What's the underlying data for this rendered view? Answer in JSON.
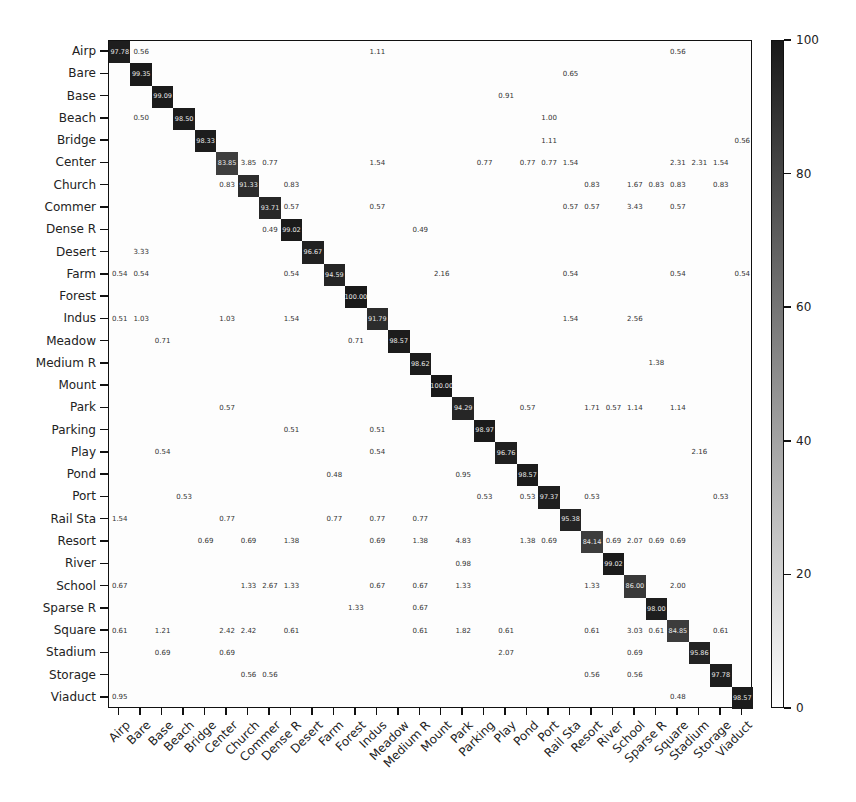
{
  "chart_data": {
    "type": "heatmap",
    "title": "",
    "xlabel": "",
    "ylabel": "",
    "labels": [
      "Airp",
      "Bare",
      "Base",
      "Beach",
      "Bridge",
      "Center",
      "Church",
      "Commer",
      "Dense R",
      "Desert",
      "Farm",
      "Forest",
      "Indus",
      "Meadow",
      "Medium R",
      "Mount",
      "Park",
      "Parking",
      "Play",
      "Pond",
      "Port",
      "Rail Sta",
      "Resort",
      "River",
      "School",
      "Sparse R",
      "Square",
      "Stadium",
      "Storage",
      "Viaduct"
    ],
    "diagonal": [
      97.78,
      99.35,
      99.09,
      98.5,
      98.33,
      83.85,
      91.33,
      93.71,
      99.02,
      96.67,
      94.59,
      100.0,
      91.79,
      98.57,
      98.62,
      100.0,
      94.29,
      98.97,
      96.76,
      98.57,
      97.37,
      95.38,
      84.14,
      99.02,
      86.0,
      98.0,
      84.85,
      95.86,
      97.78,
      98.57
    ],
    "off_diagonal": [
      {
        "row": 0,
        "col": 1,
        "v": "0.56"
      },
      {
        "row": 0,
        "col": 12,
        "v": "1.11"
      },
      {
        "row": 0,
        "col": 26,
        "v": "0.56"
      },
      {
        "row": 1,
        "col": 21,
        "v": "0.65"
      },
      {
        "row": 2,
        "col": 18,
        "v": "0.91"
      },
      {
        "row": 3,
        "col": 1,
        "v": "0.50"
      },
      {
        "row": 3,
        "col": 20,
        "v": "1.00"
      },
      {
        "row": 4,
        "col": 20,
        "v": "1.11"
      },
      {
        "row": 4,
        "col": 29,
        "v": "0.56"
      },
      {
        "row": 5,
        "col": 6,
        "v": "3.85"
      },
      {
        "row": 5,
        "col": 7,
        "v": "0.77"
      },
      {
        "row": 5,
        "col": 12,
        "v": "1.54"
      },
      {
        "row": 5,
        "col": 17,
        "v": "0.77"
      },
      {
        "row": 5,
        "col": 19,
        "v": "0.77"
      },
      {
        "row": 5,
        "col": 20,
        "v": "0.77"
      },
      {
        "row": 5,
        "col": 21,
        "v": "1.54"
      },
      {
        "row": 5,
        "col": 26,
        "v": "2.31"
      },
      {
        "row": 5,
        "col": 27,
        "v": "2.31"
      },
      {
        "row": 5,
        "col": 28,
        "v": "1.54"
      },
      {
        "row": 6,
        "col": 5,
        "v": "0.83"
      },
      {
        "row": 6,
        "col": 8,
        "v": "0.83"
      },
      {
        "row": 6,
        "col": 22,
        "v": "0.83"
      },
      {
        "row": 6,
        "col": 24,
        "v": "1.67"
      },
      {
        "row": 6,
        "col": 25,
        "v": "0.83"
      },
      {
        "row": 6,
        "col": 26,
        "v": "0.83"
      },
      {
        "row": 6,
        "col": 28,
        "v": "0.83"
      },
      {
        "row": 7,
        "col": 8,
        "v": "0.57"
      },
      {
        "row": 7,
        "col": 12,
        "v": "0.57"
      },
      {
        "row": 7,
        "col": 21,
        "v": "0.57"
      },
      {
        "row": 7,
        "col": 22,
        "v": "0.57"
      },
      {
        "row": 7,
        "col": 24,
        "v": "3.43"
      },
      {
        "row": 7,
        "col": 26,
        "v": "0.57"
      },
      {
        "row": 8,
        "col": 7,
        "v": "0.49"
      },
      {
        "row": 8,
        "col": 14,
        "v": "0.49"
      },
      {
        "row": 9,
        "col": 1,
        "v": "3.33"
      },
      {
        "row": 10,
        "col": 0,
        "v": "0.54"
      },
      {
        "row": 10,
        "col": 1,
        "v": "0.54"
      },
      {
        "row": 10,
        "col": 8,
        "v": "0.54"
      },
      {
        "row": 10,
        "col": 15,
        "v": "2.16"
      },
      {
        "row": 10,
        "col": 21,
        "v": "0.54"
      },
      {
        "row": 10,
        "col": 26,
        "v": "0.54"
      },
      {
        "row": 10,
        "col": 29,
        "v": "0.54"
      },
      {
        "row": 12,
        "col": 0,
        "v": "0.51"
      },
      {
        "row": 12,
        "col": 1,
        "v": "1.03"
      },
      {
        "row": 12,
        "col": 5,
        "v": "1.03"
      },
      {
        "row": 12,
        "col": 8,
        "v": "1.54"
      },
      {
        "row": 12,
        "col": 21,
        "v": "1.54"
      },
      {
        "row": 12,
        "col": 24,
        "v": "2.56"
      },
      {
        "row": 13,
        "col": 2,
        "v": "0.71"
      },
      {
        "row": 13,
        "col": 11,
        "v": "0.71"
      },
      {
        "row": 14,
        "col": 25,
        "v": "1.38"
      },
      {
        "row": 16,
        "col": 5,
        "v": "0.57"
      },
      {
        "row": 16,
        "col": 19,
        "v": "0.57"
      },
      {
        "row": 16,
        "col": 22,
        "v": "1.71"
      },
      {
        "row": 16,
        "col": 23,
        "v": "0.57"
      },
      {
        "row": 16,
        "col": 24,
        "v": "1.14"
      },
      {
        "row": 16,
        "col": 26,
        "v": "1.14"
      },
      {
        "row": 17,
        "col": 8,
        "v": "0.51"
      },
      {
        "row": 17,
        "col": 12,
        "v": "0.51"
      },
      {
        "row": 18,
        "col": 2,
        "v": "0.54"
      },
      {
        "row": 18,
        "col": 12,
        "v": "0.54"
      },
      {
        "row": 18,
        "col": 27,
        "v": "2.16"
      },
      {
        "row": 19,
        "col": 10,
        "v": "0.48"
      },
      {
        "row": 19,
        "col": 16,
        "v": "0.95"
      },
      {
        "row": 20,
        "col": 3,
        "v": "0.53"
      },
      {
        "row": 20,
        "col": 17,
        "v": "0.53"
      },
      {
        "row": 20,
        "col": 19,
        "v": "0.53"
      },
      {
        "row": 20,
        "col": 22,
        "v": "0.53"
      },
      {
        "row": 20,
        "col": 28,
        "v": "0.53"
      },
      {
        "row": 21,
        "col": 0,
        "v": "1.54"
      },
      {
        "row": 21,
        "col": 5,
        "v": "0.77"
      },
      {
        "row": 21,
        "col": 10,
        "v": "0.77"
      },
      {
        "row": 21,
        "col": 12,
        "v": "0.77"
      },
      {
        "row": 21,
        "col": 14,
        "v": "0.77"
      },
      {
        "row": 22,
        "col": 4,
        "v": "0.69"
      },
      {
        "row": 22,
        "col": 6,
        "v": "0.69"
      },
      {
        "row": 22,
        "col": 8,
        "v": "1.38"
      },
      {
        "row": 22,
        "col": 12,
        "v": "0.69"
      },
      {
        "row": 22,
        "col": 14,
        "v": "1.38"
      },
      {
        "row": 22,
        "col": 16,
        "v": "4.83"
      },
      {
        "row": 22,
        "col": 19,
        "v": "1.38"
      },
      {
        "row": 22,
        "col": 20,
        "v": "0.69"
      },
      {
        "row": 22,
        "col": 23,
        "v": "0.69"
      },
      {
        "row": 22,
        "col": 24,
        "v": "2.07"
      },
      {
        "row": 22,
        "col": 25,
        "v": "0.69"
      },
      {
        "row": 22,
        "col": 26,
        "v": "0.69"
      },
      {
        "row": 23,
        "col": 16,
        "v": "0.98"
      },
      {
        "row": 24,
        "col": 0,
        "v": "0.67"
      },
      {
        "row": 24,
        "col": 6,
        "v": "1.33"
      },
      {
        "row": 24,
        "col": 7,
        "v": "2.67"
      },
      {
        "row": 24,
        "col": 8,
        "v": "1.33"
      },
      {
        "row": 24,
        "col": 12,
        "v": "0.67"
      },
      {
        "row": 24,
        "col": 14,
        "v": "0.67"
      },
      {
        "row": 24,
        "col": 16,
        "v": "1.33"
      },
      {
        "row": 24,
        "col": 22,
        "v": "1.33"
      },
      {
        "row": 24,
        "col": 26,
        "v": "2.00"
      },
      {
        "row": 25,
        "col": 11,
        "v": "1.33"
      },
      {
        "row": 25,
        "col": 14,
        "v": "0.67"
      },
      {
        "row": 26,
        "col": 0,
        "v": "0.61"
      },
      {
        "row": 26,
        "col": 2,
        "v": "1.21"
      },
      {
        "row": 26,
        "col": 5,
        "v": "2.42"
      },
      {
        "row": 26,
        "col": 6,
        "v": "2.42"
      },
      {
        "row": 26,
        "col": 8,
        "v": "0.61"
      },
      {
        "row": 26,
        "col": 14,
        "v": "0.61"
      },
      {
        "row": 26,
        "col": 16,
        "v": "1.82"
      },
      {
        "row": 26,
        "col": 18,
        "v": "0.61"
      },
      {
        "row": 26,
        "col": 22,
        "v": "0.61"
      },
      {
        "row": 26,
        "col": 24,
        "v": "3.03"
      },
      {
        "row": 26,
        "col": 25,
        "v": "0.61"
      },
      {
        "row": 26,
        "col": 28,
        "v": "0.61"
      },
      {
        "row": 27,
        "col": 2,
        "v": "0.69"
      },
      {
        "row": 27,
        "col": 5,
        "v": "0.69"
      },
      {
        "row": 27,
        "col": 18,
        "v": "2.07"
      },
      {
        "row": 27,
        "col": 24,
        "v": "0.69"
      },
      {
        "row": 28,
        "col": 6,
        "v": "0.56"
      },
      {
        "row": 28,
        "col": 7,
        "v": "0.56"
      },
      {
        "row": 28,
        "col": 22,
        "v": "0.56"
      },
      {
        "row": 28,
        "col": 24,
        "v": "0.56"
      },
      {
        "row": 29,
        "col": 0,
        "v": "0.95"
      },
      {
        "row": 29,
        "col": 26,
        "v": "0.48"
      }
    ],
    "colorbar": {
      "min": 0,
      "max": 100,
      "ticks": [
        0,
        20,
        40,
        60,
        80,
        100
      ],
      "colormap": "Greys"
    },
    "value_range": [
      0,
      100
    ],
    "grid": false,
    "legend_position": "right (colorbar)"
  }
}
